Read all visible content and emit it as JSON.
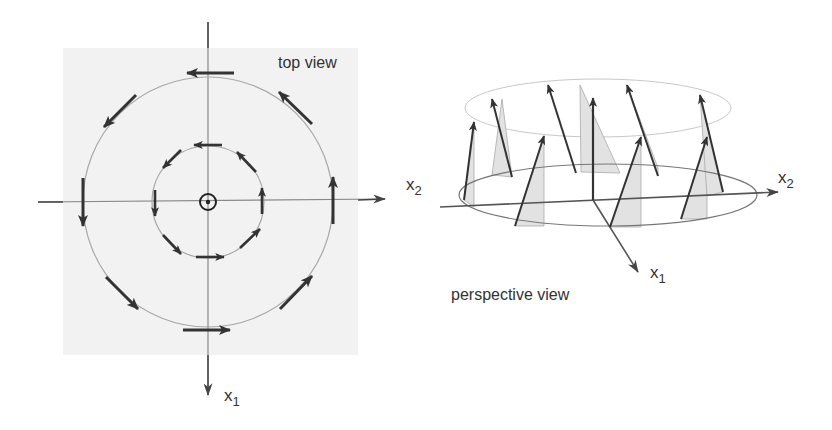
{
  "top_view": {
    "title": "top view",
    "axis_horizontal": {
      "label": "x",
      "subscript": "2"
    },
    "axis_vertical": {
      "label": "x",
      "subscript": "1"
    },
    "center_symbol": "out-of-plane-dot",
    "circles": [
      {
        "name": "inner",
        "radius_px": 56,
        "arrow_count": 8,
        "direction": "counterclockwise-on-screen"
      },
      {
        "name": "outer",
        "radius_px": 125,
        "arrow_count": 8,
        "direction": "counterclockwise-on-screen"
      }
    ]
  },
  "perspective_view": {
    "title": "perspective view",
    "axis_horizontal": {
      "label": "x",
      "subscript": "2"
    },
    "axis_depth": {
      "label": "x",
      "subscript": "1"
    },
    "tilted_arrow_count": 8,
    "center_arrow": "vertical"
  },
  "colors": {
    "background": "#ffffff",
    "panel": "#f2f2f2",
    "arrow": "#333333",
    "circle": "#a8a8a8",
    "axis": "#555555",
    "shade": "#dcdcdc"
  }
}
